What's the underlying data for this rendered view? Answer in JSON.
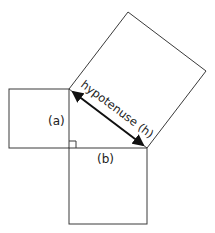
{
  "diagram": {
    "labels": {
      "side_a": "(a)",
      "side_b": "(b)",
      "hypotenuse": "hypotenuse (h)"
    },
    "colors": {
      "stroke": "#3a3a3a",
      "arrow": "#111111",
      "text": "#222222",
      "background": "#ffffff"
    },
    "shapes": {
      "square_a": {
        "x": 9,
        "y": 89,
        "size": 60
      },
      "square_b": {
        "x": 69,
        "y": 148,
        "size": 78
      },
      "square_h": [
        [
          69,
          89
        ],
        [
          147,
          148
        ],
        [
          206,
          71
        ],
        [
          128,
          12
        ]
      ],
      "right_angle_marker": {
        "x": 69,
        "y": 142,
        "size": 7
      }
    }
  }
}
